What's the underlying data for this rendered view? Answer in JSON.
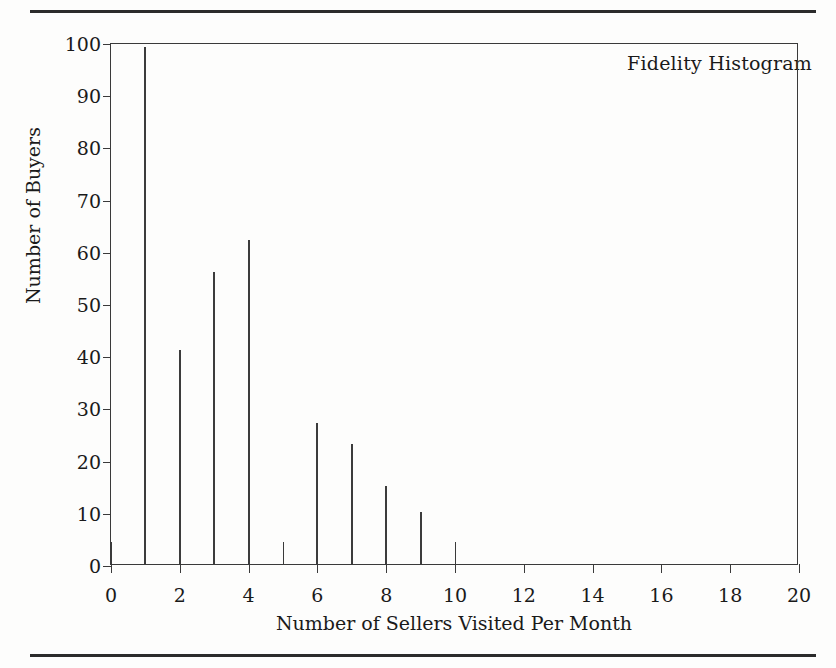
{
  "figure": {
    "top_rule": "horizontal-rule",
    "bottom_rule": "horizontal-rule"
  },
  "chart_data": {
    "type": "bar",
    "title": "Fidelity Histogram",
    "xlabel": "Number of Sellers Visited Per Month",
    "ylabel": "Number of Buyers",
    "x": [
      1,
      2,
      3,
      4,
      6,
      7,
      8,
      9
    ],
    "values": [
      99,
      41,
      56,
      62,
      27,
      23,
      15,
      10
    ],
    "categories": [
      "1",
      "2",
      "3",
      "4",
      "6",
      "7",
      "8",
      "9"
    ],
    "xlim": [
      0,
      20
    ],
    "ylim": [
      0,
      100
    ],
    "x_ticks": [
      0,
      2,
      4,
      6,
      8,
      10,
      12,
      14,
      16,
      18,
      20
    ],
    "x_tick_labels": [
      "0",
      "2",
      "4",
      "6",
      "8",
      "10",
      "12",
      "14",
      "16",
      "18",
      "20"
    ],
    "x_minor_ticks": [
      0,
      1,
      2,
      3,
      4,
      5,
      6,
      7,
      8,
      9,
      10
    ],
    "y_ticks": [
      0,
      10,
      20,
      30,
      40,
      50,
      60,
      70,
      80,
      90,
      100
    ],
    "y_tick_labels": [
      "0",
      "10",
      "20",
      "30",
      "40",
      "50",
      "60",
      "70",
      "80",
      "90",
      "100"
    ],
    "grid": false,
    "legend": false,
    "bar_color": "#3c3c3c",
    "axis_color": "#3a3a3a",
    "background": "#ffffff"
  }
}
